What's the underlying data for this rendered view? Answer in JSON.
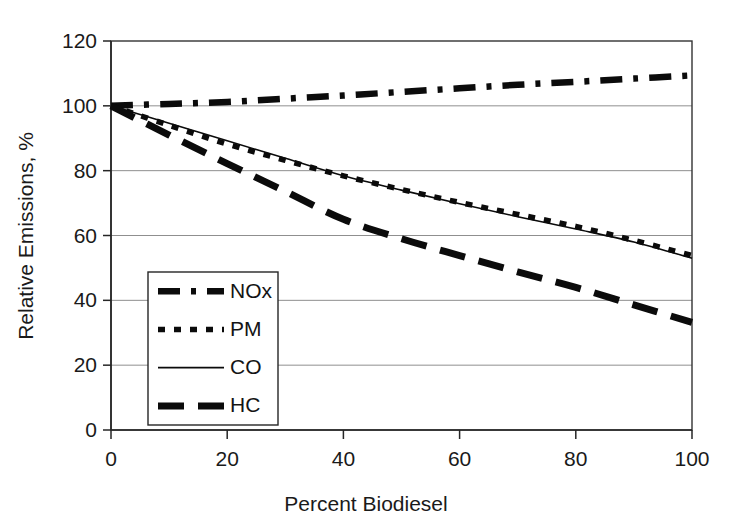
{
  "chart_data": {
    "type": "line",
    "title": "",
    "xlabel": "Percent Biodiesel",
    "ylabel": "Relative Emissions, %",
    "xlim": [
      0,
      100
    ],
    "ylim": [
      0,
      120
    ],
    "xticks": [
      0,
      20,
      40,
      60,
      80,
      100
    ],
    "yticks": [
      0,
      20,
      40,
      60,
      80,
      100,
      120
    ],
    "xtick_labels": [
      "0",
      "20",
      "40",
      "60",
      "80",
      "100"
    ],
    "ytick_labels": [
      "0",
      "20",
      "40",
      "60",
      "80",
      "100",
      "120"
    ],
    "grid": "horizontal",
    "legend_position": "lower-left-inside",
    "x": [
      0,
      10,
      20,
      30,
      40,
      50,
      60,
      70,
      80,
      90,
      100
    ],
    "series": [
      {
        "name": "NOx",
        "style": "dash-dot",
        "values": [
          100,
          100.6,
          101.2,
          102.2,
          103.2,
          104.3,
          105.4,
          106.5,
          107.4,
          108.4,
          109.4
        ]
      },
      {
        "name": "PM",
        "style": "dotted",
        "values": [
          100,
          94.0,
          88.2,
          83.2,
          78.4,
          74.2,
          70.2,
          66.5,
          62.8,
          58.5,
          53.8
        ]
      },
      {
        "name": "CO",
        "style": "solid",
        "values": [
          100,
          94.6,
          89.2,
          83.8,
          78.4,
          74.0,
          69.8,
          65.8,
          62.0,
          58.0,
          53.0
        ]
      },
      {
        "name": "HC",
        "style": "long-dash",
        "values": [
          100,
          91.0,
          82.2,
          73.6,
          65.0,
          59.0,
          53.8,
          48.8,
          44.0,
          38.6,
          33.2
        ]
      }
    ]
  },
  "legend": {
    "items": [
      {
        "label": "NOx",
        "style": "dash-dot"
      },
      {
        "label": "PM",
        "style": "dotted"
      },
      {
        "label": "CO",
        "style": "solid"
      },
      {
        "label": "HC",
        "style": "long-dash"
      }
    ]
  },
  "colors": {
    "series_stroke": "#0b0b0b",
    "grid": "#8f8f8f",
    "axis": "#262626",
    "background": "#ffffff"
  }
}
